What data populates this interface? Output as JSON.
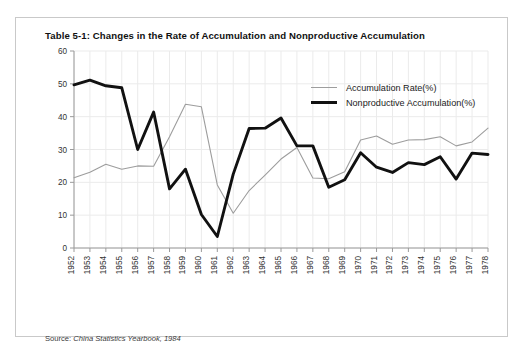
{
  "figure": {
    "title": "Table 5-1: Changes in the Rate of Accumulation and Nonproductive Accumulation",
    "source_lead": "Source: ",
    "source_text": "China Statistics Yearbook, 1984",
    "frame_color": "#c9c9c9",
    "background": "#ffffff"
  },
  "legend": {
    "position": "inside-top-right",
    "entries": [
      {
        "label": "Accumulation Rate(%)",
        "color": "#9d9d9d",
        "style": "thin-line"
      },
      {
        "label": "Nonproductive Accumulation(%)",
        "color": "#111111",
        "style": "thick-line"
      }
    ]
  },
  "chart_data": {
    "type": "line",
    "title": "Table 5-1: Changes in the Rate of Accumulation and Nonproductive Accumulation",
    "xlabel": "",
    "ylabel": "",
    "ylim": [
      0,
      60
    ],
    "yticks": [
      0,
      10,
      20,
      30,
      40,
      50,
      60
    ],
    "grid": true,
    "legend": "top-right",
    "categories": [
      "1952",
      "1953",
      "1954",
      "1955",
      "1956",
      "1957",
      "1958",
      "1959",
      "1960",
      "1961",
      "1962",
      "1963",
      "1964",
      "1965",
      "1966",
      "1967",
      "1968",
      "1969",
      "1970",
      "1971",
      "1972",
      "1973",
      "1974",
      "1975",
      "1976",
      "1977",
      "1978"
    ],
    "series": [
      {
        "name": "Accumulation Rate(%)",
        "color": "#9d9d9d",
        "values": [
          21.4,
          23.1,
          25.5,
          24.0,
          25.0,
          24.9,
          33.9,
          43.8,
          43.0,
          19.2,
          10.6,
          17.5,
          22.2,
          27.1,
          30.6,
          21.3,
          21.1,
          23.2,
          32.9,
          34.1,
          31.6,
          32.9,
          33.0,
          33.9,
          31.1,
          32.3,
          36.5
        ]
      },
      {
        "name": "Nonproductive Accumulation(%)",
        "color": "#111111",
        "values": [
          49.7,
          51.1,
          49.4,
          48.8,
          30.0,
          41.4,
          18.0,
          24.0,
          10.2,
          3.5,
          22.5,
          36.4,
          36.5,
          39.6,
          31.1,
          31.1,
          18.5,
          20.8,
          29.0,
          24.6,
          23.0,
          26.0,
          25.4,
          27.8,
          21.0,
          28.9,
          28.5
        ]
      }
    ]
  }
}
